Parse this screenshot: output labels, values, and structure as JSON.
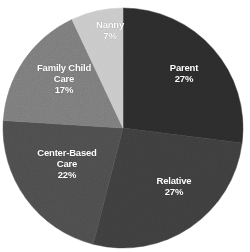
{
  "chart_data": {
    "type": "pie",
    "title": "",
    "subtitle": "",
    "xlabel": "",
    "ylabel": "",
    "legend_position": "none",
    "labels_inside_slices": true,
    "start_angle_deg": 0,
    "direction": "clockwise",
    "total": 100,
    "units": "%",
    "categories": [
      "Parent",
      "Relative",
      "Center-Based Care",
      "Family Child Care",
      "Nanny"
    ],
    "values": [
      27,
      27,
      22,
      17,
      7
    ],
    "colors": [
      "#2b2b2b",
      "#3d3d3d",
      "#4c4c4c",
      "#7a7a7a",
      "#c8c8c8"
    ],
    "slices": [
      {
        "name": "Parent",
        "value": 27,
        "value_label": "27%",
        "label_line1": "Parent",
        "color": "#2b2b2b",
        "label_x": 184,
        "label_y": 73
      },
      {
        "name": "Relative",
        "value": 27,
        "value_label": "27%",
        "label_line1": "Relative",
        "color": "#3d3d3d",
        "label_x": 174,
        "label_y": 186
      },
      {
        "name": "Center-Based Care",
        "value": 22,
        "value_label": "22%",
        "label_line1": "Center-Based",
        "label_line2": "Care",
        "color": "#4c4c4c",
        "label_x": 67,
        "label_y": 163
      },
      {
        "name": "Family Child Care",
        "value": 17,
        "value_label": "17%",
        "label_line1": "Family Child",
        "label_line2": "Care",
        "color": "#7a7a7a",
        "label_x": 64,
        "label_y": 78
      },
      {
        "name": "Nanny",
        "value": 7,
        "value_label": "7%",
        "label_line1": "Nanny",
        "color": "#c8c8c8",
        "label_x": 110,
        "label_y": 30
      }
    ],
    "geometry": {
      "center_x": 123,
      "center_y": 128,
      "radius": 120
    },
    "background_color": "#ffffff",
    "label_color": "#ffffff"
  }
}
